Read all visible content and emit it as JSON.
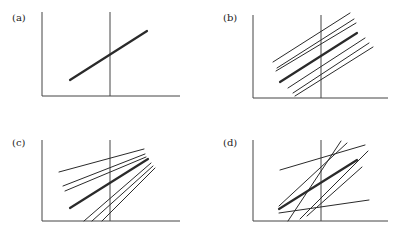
{
  "figure": {
    "width": 406,
    "height": 228,
    "line_color": "#2a2a2a",
    "axis_color": "#444444",
    "panels": [
      {
        "id": "a",
        "label": "(a)",
        "label_pos": [
          22,
          23
        ],
        "axes": {
          "x0": 42,
          "y_top": 12,
          "y_base": 96,
          "x_end": 180
        },
        "vline": {
          "x": 110,
          "y_top": 12,
          "y_bot": 96
        },
        "lines": [
          {
            "x1": 70,
            "y1": 80,
            "x2": 147,
            "y2": 31,
            "w": 2.2
          }
        ]
      },
      {
        "id": "b",
        "label": "(b)",
        "label_pos": [
          233,
          23
        ],
        "axes": {
          "x0": 253,
          "y_top": 15,
          "y_base": 98,
          "x_end": 388
        },
        "vline": {
          "x": 321,
          "y_top": 15,
          "y_bot": 98
        },
        "lines": [
          {
            "x1": 273,
            "y1": 62,
            "x2": 350,
            "y2": 13,
            "w": 1
          },
          {
            "x1": 277,
            "y1": 68,
            "x2": 354,
            "y2": 19,
            "w": 1
          },
          {
            "x1": 276,
            "y1": 71,
            "x2": 356,
            "y2": 23,
            "w": 1
          },
          {
            "x1": 280,
            "y1": 82,
            "x2": 357,
            "y2": 33,
            "w": 2.2
          },
          {
            "x1": 288,
            "y1": 88,
            "x2": 365,
            "y2": 38,
            "w": 1
          },
          {
            "x1": 293,
            "y1": 93,
            "x2": 369,
            "y2": 43,
            "w": 1
          },
          {
            "x1": 295,
            "y1": 96,
            "x2": 373,
            "y2": 47,
            "w": 1
          }
        ]
      },
      {
        "id": "c",
        "label": "(c)",
        "label_pos": [
          22,
          148
        ],
        "axes": {
          "x0": 42,
          "y_top": 140,
          "y_base": 221,
          "x_end": 180
        },
        "vline": {
          "x": 110,
          "y_top": 140,
          "y_bot": 221
        },
        "lines": [
          {
            "x1": 59,
            "y1": 172,
            "x2": 144,
            "y2": 149,
            "w": 1
          },
          {
            "x1": 63,
            "y1": 186,
            "x2": 145,
            "y2": 154,
            "w": 1
          },
          {
            "x1": 65,
            "y1": 191,
            "x2": 146,
            "y2": 157,
            "w": 1
          },
          {
            "x1": 70,
            "y1": 208,
            "x2": 148,
            "y2": 159,
            "w": 2.2
          },
          {
            "x1": 84,
            "y1": 221,
            "x2": 151,
            "y2": 163,
            "w": 1
          },
          {
            "x1": 92,
            "y1": 221,
            "x2": 153,
            "y2": 166,
            "w": 1
          },
          {
            "x1": 102,
            "y1": 221,
            "x2": 155,
            "y2": 168,
            "w": 1
          }
        ]
      },
      {
        "id": "d",
        "label": "(d)",
        "label_pos": [
          233,
          148
        ],
        "axes": {
          "x0": 253,
          "y_top": 140,
          "y_base": 221,
          "x_end": 388
        },
        "vline": {
          "x": 321,
          "y_top": 140,
          "y_bot": 221
        },
        "lines": [
          {
            "x1": 280,
            "y1": 170,
            "x2": 365,
            "y2": 145,
            "w": 1
          },
          {
            "x1": 279,
            "y1": 209,
            "x2": 357,
            "y2": 160,
            "w": 2.2
          },
          {
            "x1": 279,
            "y1": 206,
            "x2": 347,
            "y2": 143,
            "w": 1
          },
          {
            "x1": 288,
            "y1": 221,
            "x2": 341,
            "y2": 141,
            "w": 1
          },
          {
            "x1": 300,
            "y1": 219,
            "x2": 368,
            "y2": 151,
            "w": 1
          },
          {
            "x1": 307,
            "y1": 216,
            "x2": 362,
            "y2": 167,
            "w": 1
          },
          {
            "x1": 279,
            "y1": 213,
            "x2": 369,
            "y2": 200,
            "w": 1
          }
        ]
      }
    ]
  }
}
